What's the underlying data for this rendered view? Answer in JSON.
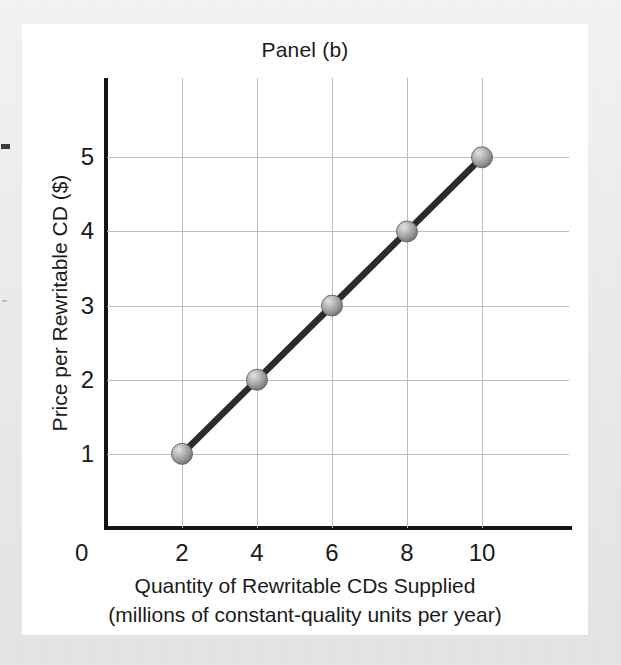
{
  "figure": {
    "title": "Panel (b)",
    "background_color": "#ffffff",
    "surround_color": "#e6e6e6"
  },
  "chart_data": {
    "type": "line",
    "title": "Panel (b)",
    "xlabel": "Quantity of Rewritable CDs Supplied",
    "xlabel_line2": "(millions of constant-quality units per year)",
    "ylabel": "Price per Rewritable CD ($)",
    "x": [
      2,
      4,
      6,
      8,
      10
    ],
    "values": [
      1,
      2,
      3,
      4,
      5
    ],
    "series": [
      {
        "name": "Supply",
        "x": [
          2,
          4,
          6,
          8,
          10
        ],
        "values": [
          1,
          2,
          3,
          4,
          5
        ]
      }
    ],
    "xlim": [
      0,
      12.32
    ],
    "ylim": [
      0,
      6.07
    ],
    "xticks": [
      0,
      2,
      4,
      6,
      8,
      10
    ],
    "xtick_labels": [
      "0",
      "2",
      "4",
      "6",
      "8",
      "10"
    ],
    "yticks": [
      1,
      2,
      3,
      4,
      5
    ],
    "ytick_labels": [
      "1",
      "2",
      "3",
      "4",
      "5"
    ],
    "grid": true,
    "legend": false,
    "line_color": "#2b2b2b",
    "marker": "sphere",
    "marker_color": "#9a9a9a",
    "grid_color": "#bdbdbd",
    "axis_color": "#151515"
  }
}
